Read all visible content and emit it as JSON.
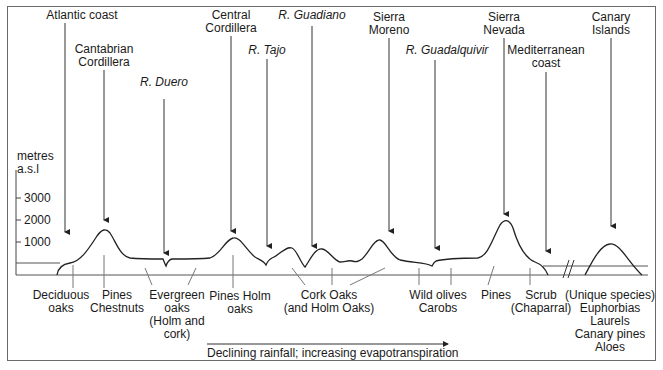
{
  "diagram": {
    "title": "",
    "y_axis": {
      "unit_line1": "metres",
      "unit_line2": "a.s.l",
      "ticks": [
        "3000",
        "2000",
        "1000"
      ]
    },
    "top_labels": [
      {
        "id": "atlantic",
        "line1": "Atlantic coast",
        "line2": "",
        "italic": false
      },
      {
        "id": "cantabrian",
        "line1": "Cantabrian",
        "line2": "Cordillera",
        "italic": false
      },
      {
        "id": "duero",
        "line1": "R. Duero",
        "line2": "",
        "italic": true
      },
      {
        "id": "central",
        "line1": "Central",
        "line2": "Cordillera",
        "italic": false
      },
      {
        "id": "tajo",
        "line1": "R. Tajo",
        "line2": "",
        "italic": true
      },
      {
        "id": "guadiano",
        "line1": "R. Guadiano",
        "line2": "",
        "italic": true
      },
      {
        "id": "morena",
        "line1": "Sierra",
        "line2": "Moreno",
        "italic": false
      },
      {
        "id": "guadalquivir",
        "line1": "R. Guadalquivir",
        "line2": "",
        "italic": true
      },
      {
        "id": "nevada",
        "line1": "Sierra",
        "line2": "Nevada",
        "italic": false
      },
      {
        "id": "mediterranean",
        "line1": "Mediterranean",
        "line2": "coast",
        "italic": false
      },
      {
        "id": "canary",
        "line1": "Canary",
        "line2": "Islands",
        "italic": false
      }
    ],
    "vegetation_labels": [
      {
        "id": "deciduous",
        "lines": [
          "Deciduous",
          "oaks"
        ]
      },
      {
        "id": "pines-chestnuts",
        "lines": [
          "Pines",
          "Chestnuts"
        ]
      },
      {
        "id": "evergreen",
        "lines": [
          "Evergreen",
          "oaks",
          "(Holm and",
          "cork)"
        ]
      },
      {
        "id": "pines-holm",
        "lines": [
          "Pines Holm",
          "oaks"
        ]
      },
      {
        "id": "cork-oaks",
        "lines": [
          "Cork Oaks",
          "(and Holm Oaks)"
        ]
      },
      {
        "id": "wild-olives",
        "lines": [
          "Wild olives",
          "Carobs"
        ]
      },
      {
        "id": "pines",
        "lines": [
          "Pines"
        ]
      },
      {
        "id": "scrub",
        "lines": [
          "Scrub",
          "(Chaparral)"
        ]
      },
      {
        "id": "unique",
        "lines": [
          "(Unique species)",
          "Euphorbias",
          "Laurels",
          "Canary pines",
          "Aloes"
        ]
      }
    ],
    "caption": "Declining rainfall; increasing evapotranspiration"
  }
}
